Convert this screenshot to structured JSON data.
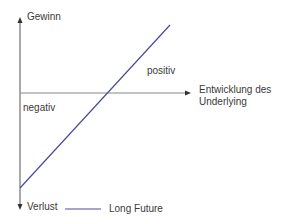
{
  "diagram": {
    "title": "",
    "y_axis": {
      "top_label": "Gewinn",
      "bottom_label": "Verlust"
    },
    "x_axis": {
      "label_line1": "Entwicklung des",
      "label_line2": "Underlying"
    },
    "regions": {
      "positive": "positiv",
      "negative": "negativ"
    },
    "series": [
      {
        "name": "Long Future",
        "color": "#4a4aa0",
        "from": [
          20,
          188
        ],
        "to": [
          170,
          25
        ]
      }
    ],
    "legend": {
      "label": "Long Future"
    },
    "colors": {
      "axis": "#555555",
      "line": "#4a4aa0"
    }
  }
}
